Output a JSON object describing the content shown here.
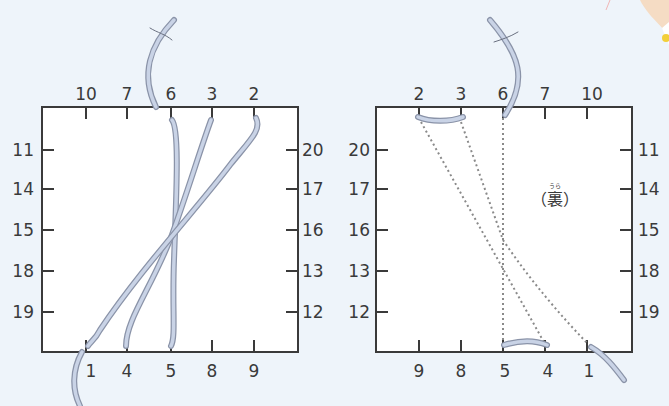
{
  "colors": {
    "background": "#eef4fa",
    "panel_fill": "#ffffff",
    "frame": "#3a3a3a",
    "thread_fill": "#c9d3e6",
    "thread_edge": "#8a93a8",
    "dotted": "#8a8a8a",
    "decoration_peach": "#f3c9a0",
    "decoration_yellow": "#f2cf3a"
  },
  "front_panel": {
    "name": "front",
    "top_labels": [
      "10",
      "7",
      "6",
      "3",
      "2"
    ],
    "bottom_labels": [
      "1",
      "4",
      "5",
      "8",
      "9"
    ],
    "left_labels": [
      "11",
      "14",
      "15",
      "18",
      "19"
    ],
    "right_labels": [
      "20",
      "17",
      "16",
      "13",
      "12"
    ]
  },
  "back_panel": {
    "name": "back",
    "caption": "（裏）",
    "caption_text": "裏",
    "caption_ruby": "うら",
    "top_labels": [
      "2",
      "3",
      "6",
      "7",
      "10"
    ],
    "bottom_labels": [
      "9",
      "8",
      "5",
      "4",
      "1"
    ],
    "left_labels": [
      "20",
      "17",
      "16",
      "13",
      "12"
    ],
    "right_labels": [
      "11",
      "14",
      "15",
      "18",
      "19"
    ]
  }
}
